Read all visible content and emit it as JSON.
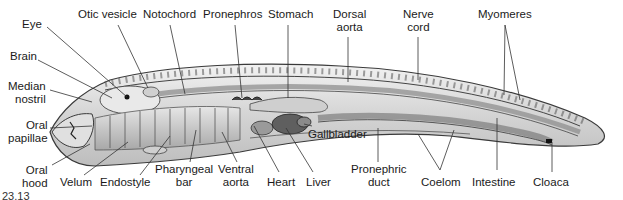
{
  "figure": {
    "figure_number_fragment": "23.13"
  },
  "labels": {
    "eye": "Eye",
    "brain": "Brain",
    "median_nostril": "Median\nnostril",
    "oral_papillae": "Oral\npapillae",
    "oral_hood": "Oral\nhood",
    "otic_vesicle": "Otic vesicle",
    "notochord": "Notochord",
    "pronephros": "Pronephros",
    "stomach": "Stomach",
    "dorsal_aorta": "Dorsal\naorta",
    "nerve_cord": "Nerve\ncord",
    "myomeres": "Myomeres",
    "velum": "Velum",
    "endostyle": "Endostyle",
    "pharyngeal_bar": "Pharyngeal\nbar",
    "ventral_aorta": "Ventral\naorta",
    "heart": "Heart",
    "liver": "Liver",
    "gallbladder": "Gallbladder",
    "pronephric_duct": "Pronephric\nduct",
    "coelom": "Coelom",
    "intestine": "Intestine",
    "cloaca": "Cloaca"
  },
  "colors": {
    "outline": "#3a3a3a",
    "body_fill": "#d9d9d9",
    "body_light": "#ececec",
    "organ_dark": "#6e6e6e",
    "leader": "#333333"
  }
}
